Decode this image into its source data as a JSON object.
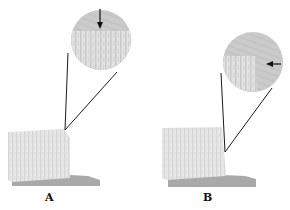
{
  "figure": {
    "panels": [
      {
        "id": "A",
        "label": "A",
        "arrow_direction": "down",
        "inset_shows": "surface with vertical striations; arrow pointing down at top edge"
      },
      {
        "id": "B",
        "label": "B",
        "arrow_direction": "left",
        "inset_shows": "corner of block edge; arrow pointing left at right side"
      }
    ],
    "colors": {
      "block_face": "#e6e6e6",
      "block_texture": "#d2d2d2",
      "base_slab": "#a9a9a9",
      "inset_background": "#cdcdcd",
      "connector_line": "#1a1a1a",
      "arrow": "#111111"
    }
  }
}
